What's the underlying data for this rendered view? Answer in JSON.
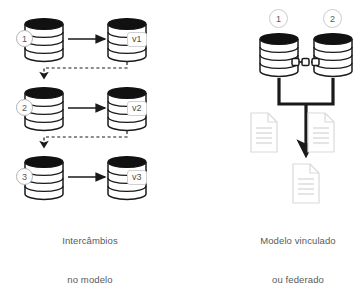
{
  "diagram": {
    "title_not_shown": "",
    "background_color": "#ffffff",
    "left_panel": {
      "caption_line1": "Intercâmbios",
      "caption_line2": "no modelo",
      "rows": [
        {
          "source_badge": "1",
          "version_label": "v1",
          "arrow": "right-arrow-icon",
          "source_icon": "database-cylinder-icon",
          "target_icon": "database-cylinder-icon"
        },
        {
          "source_badge": "2",
          "version_label": "v2",
          "arrow": "right-arrow-icon",
          "source_icon": "database-cylinder-icon",
          "target_icon": "database-cylinder-icon"
        },
        {
          "source_badge": "3",
          "version_label": "v3",
          "arrow": "right-arrow-icon",
          "source_icon": "database-cylinder-icon",
          "target_icon": "database-cylinder-icon"
        }
      ],
      "feedback_connector": "dashed-feedback-arrow-icon"
    },
    "right_panel": {
      "caption_line1": "Modelo vinculado",
      "caption_line2": "ou federado",
      "badges": [
        "1",
        "2"
      ],
      "cylinders": [
        "database-cylinder-icon",
        "database-cylinder-icon"
      ],
      "link_icon": "chain-link-icon",
      "merge_arrow": "merge-down-arrow-icon",
      "side_documents": [
        "document-icon",
        "document-icon"
      ],
      "result_document": "document-icon"
    },
    "colors": {
      "stroke_dark": "#1a1a1a",
      "stroke_grey": "#b3b3b3",
      "text_grey": "#595959",
      "doc_outline": "#d9d9d9",
      "doc_line": "#cccccc",
      "cylinder_top_fill": "#111111"
    }
  }
}
